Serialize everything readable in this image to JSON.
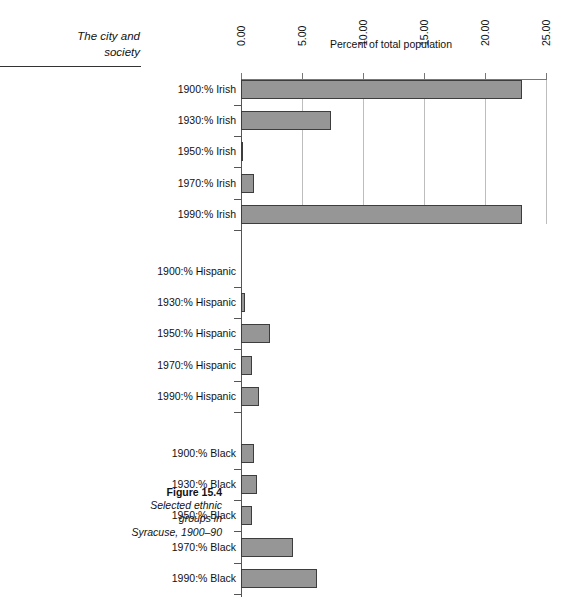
{
  "running_head": {
    "line1": "The city and",
    "line2": "society"
  },
  "figure_caption": {
    "number": "Figure 15.4",
    "line2": "Selected ethnic",
    "line3": "groups in",
    "line4": "Syracuse, 1900–90"
  },
  "chart_data": {
    "type": "bar",
    "orientation": "horizontal",
    "title": "Percent of total population",
    "xlabel": "Percent of total population",
    "ylabel": "",
    "xlim": [
      0,
      25
    ],
    "xticks": [
      "0.00",
      "5.00",
      "10.00",
      "15.00",
      "20.00",
      "25.00"
    ],
    "xtick_values": [
      0,
      5,
      10,
      15,
      20,
      25
    ],
    "grid": false,
    "legend": "none",
    "bar_color": "#969696",
    "bar_edge_color": "#3d3d3d",
    "groups": [
      {
        "name": "Irish",
        "categories": [
          "1900:% Irish",
          "1930:% Irish",
          "1950:% Irish",
          "1970:% Irish",
          "1990:% Irish"
        ],
        "values": [
          23.0,
          7.4,
          0.2,
          1.1,
          23.0
        ]
      },
      {
        "name": "Hispanic",
        "categories": [
          "1900:% Hispanic",
          "1930:% Hispanic",
          "1950:% Hispanic",
          "1970:% Hispanic",
          "1990:% Hispanic"
        ],
        "values": [
          0.0,
          0.35,
          2.4,
          0.9,
          1.5
        ]
      },
      {
        "name": "Black",
        "categories": [
          "1900:% Black",
          "1930:% Black",
          "1950:% Black",
          "1970:% Black",
          "1990:% Black"
        ],
        "values": [
          1.1,
          1.3,
          0.9,
          4.3,
          6.2
        ]
      }
    ]
  }
}
